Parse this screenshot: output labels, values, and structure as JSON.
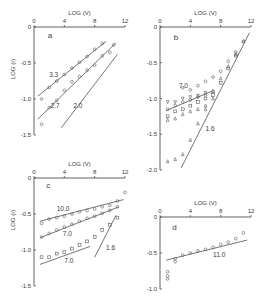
{
  "figure": {
    "colors": {
      "ink": "#3a3a3a",
      "marker": "#5a5a5a",
      "background": "#ffffff"
    }
  },
  "chart_data": [
    {
      "panel": "a",
      "type": "scatter",
      "xlabel": "LOG (V)",
      "ylabel": "LOG (r)",
      "xlim": [
        0,
        12
      ],
      "ylim": [
        -1.5,
        0
      ],
      "xticks": [
        0,
        4,
        8,
        12
      ],
      "yticks": [
        0,
        -0.5,
        -1.0,
        -1.5
      ],
      "ytick_labels": [
        "0",
        "-0.5",
        "-1.0",
        "-1.5"
      ],
      "grid": false,
      "frame": {
        "x": 34,
        "y": 27,
        "w": 91,
        "h": 108
      },
      "series": [
        {
          "name": "3.3",
          "marker": "circle",
          "points": [
            [
              1,
              -1.0
            ],
            [
              2,
              -0.84
            ],
            [
              3,
              -0.75
            ],
            [
              4,
              -0.66
            ],
            [
              5,
              -0.57
            ],
            [
              6,
              -0.49
            ],
            [
              7,
              -0.41
            ],
            [
              8,
              -0.31
            ],
            [
              9,
              -0.23
            ]
          ]
        },
        {
          "name": "2.7",
          "marker": "circle",
          "points": [
            [
              1,
              -1.35
            ],
            [
              2,
              -1.12
            ],
            [
              3,
              -1.02
            ],
            [
              4,
              -0.88
            ],
            [
              5,
              -0.76
            ],
            [
              6,
              -0.69
            ],
            [
              7,
              -0.6
            ],
            [
              8,
              -0.53
            ],
            [
              9,
              -0.4
            ],
            [
              10,
              -0.35
            ],
            [
              10.5,
              -0.25
            ]
          ]
        }
      ],
      "lines": [
        {
          "label": "3.3",
          "from": [
            0.5,
            -0.96
          ],
          "to": [
            9.5,
            -0.2
          ],
          "label_at": [
            2.0,
            -0.7
          ]
        },
        {
          "label": "2.7",
          "from": [
            0.5,
            -1.28
          ],
          "to": [
            10.8,
            -0.22
          ],
          "label_at": [
            2.2,
            -1.12
          ]
        },
        {
          "label": "2.0",
          "from": [
            3.6,
            -1.4
          ],
          "to": [
            11.0,
            -0.38
          ],
          "label_at": [
            5.2,
            -1.12
          ]
        }
      ],
      "annotations": [
        {
          "text": "a",
          "at": [
            1.8,
            -0.15
          ]
        }
      ]
    },
    {
      "panel": "b",
      "type": "scatter",
      "xlabel": "LOG (V)",
      "ylabel": "LOG (r)",
      "xlim": [
        0,
        12
      ],
      "ylim": [
        -2.0,
        0
      ],
      "xticks": [
        0,
        4,
        8,
        12
      ],
      "yticks": [
        0,
        -0.5,
        -1.0,
        -1.5,
        -2.0
      ],
      "ytick_labels": [
        "0",
        "-0.5",
        "-1.0",
        "-1.5",
        "-2.0"
      ],
      "grid": false,
      "frame": {
        "x": 160,
        "y": 27,
        "w": 91,
        "h": 143
      },
      "series": [
        {
          "name": "7.0 (circles)",
          "marker": "circle",
          "points": [
            [
              1,
              -1.15
            ],
            [
              2,
              -1.1
            ],
            [
              3,
              -1.05
            ],
            [
              4,
              -1.02
            ],
            [
              5,
              -0.98
            ],
            [
              6,
              -0.95
            ],
            [
              7,
              -0.9
            ],
            [
              3,
              -0.85
            ],
            [
              4,
              -0.88
            ],
            [
              5,
              -0.82
            ],
            [
              6,
              -0.76
            ],
            [
              7,
              -0.7
            ],
            [
              8,
              -0.62
            ],
            [
              9,
              -0.48
            ],
            [
              10,
              -0.35
            ],
            [
              11,
              -0.2
            ]
          ]
        },
        {
          "name": "7.0 (triangles-down)",
          "marker": "triangle-down",
          "points": [
            [
              1,
              -1.05
            ],
            [
              2,
              -1.05
            ],
            [
              3,
              -1.0
            ],
            [
              4,
              -0.98
            ],
            [
              5,
              -0.96
            ],
            [
              6,
              -0.92
            ]
          ]
        },
        {
          "name": "7.0 (squares)",
          "marker": "square",
          "points": [
            [
              1,
              -1.25
            ],
            [
              2,
              -1.18
            ],
            [
              3,
              -1.15
            ],
            [
              4,
              -1.1
            ],
            [
              5,
              -1.05
            ],
            [
              6,
              -1.0
            ],
            [
              7,
              -0.95
            ],
            [
              8,
              -0.78
            ],
            [
              9,
              -0.58
            ],
            [
              10,
              -0.4
            ]
          ]
        },
        {
          "name": "1.6 (triangles)",
          "marker": "triangle",
          "points": [
            [
              1,
              -1.3
            ],
            [
              2,
              -1.28
            ],
            [
              3,
              -1.22
            ],
            [
              4,
              -1.18
            ],
            [
              5,
              -1.15
            ],
            [
              6,
              -1.1
            ],
            [
              7,
              -1.0
            ],
            [
              1,
              -1.88
            ],
            [
              2,
              -1.85
            ],
            [
              3,
              -1.78
            ],
            [
              4,
              -1.58
            ],
            [
              5,
              -1.35
            ],
            [
              6,
              -1.15
            ],
            [
              7,
              -0.9
            ],
            [
              8,
              -0.72
            ],
            [
              9,
              -0.55
            ],
            [
              10,
              -0.38
            ],
            [
              11,
              -0.2
            ]
          ]
        }
      ],
      "lines": [
        {
          "label": "7.0",
          "from": [
            0.8,
            -1.17
          ],
          "to": [
            6.8,
            -0.9
          ],
          "label_at": [
            2.5,
            -0.85
          ]
        },
        {
          "label": "1.6",
          "from": [
            2.8,
            -1.97
          ],
          "to": [
            11.8,
            -0.08
          ],
          "label_at": [
            6.0,
            -1.45
          ]
        }
      ],
      "annotations": [
        {
          "text": "b",
          "at": [
            1.8,
            -0.18
          ]
        }
      ]
    },
    {
      "panel": "c",
      "type": "scatter",
      "xlabel": "LOG (V)",
      "ylabel": "LOG (r)",
      "xlim": [
        0,
        12
      ],
      "ylim": [
        -1.5,
        0
      ],
      "xticks": [
        0,
        4,
        8,
        12
      ],
      "yticks": [
        0,
        -0.5,
        -1.0,
        -1.5
      ],
      "ytick_labels": [
        "0",
        "-0.5",
        "-1.0",
        "-1.5"
      ],
      "grid": false,
      "frame": {
        "x": 34,
        "y": 178,
        "w": 91,
        "h": 108
      },
      "series": [
        {
          "name": "10.0",
          "marker": "circle",
          "points": [
            [
              1,
              -0.63
            ],
            [
              2,
              -0.57
            ],
            [
              3,
              -0.55
            ],
            [
              4,
              -0.53
            ],
            [
              5,
              -0.5
            ],
            [
              6,
              -0.47
            ],
            [
              7,
              -0.45
            ],
            [
              8,
              -0.43
            ],
            [
              9,
              -0.4
            ],
            [
              10,
              -0.38
            ],
            [
              11,
              -0.32
            ],
            [
              12,
              -0.2
            ]
          ]
        },
        {
          "name": "7.0 upper",
          "marker": "circle",
          "points": [
            [
              1,
              -0.82
            ],
            [
              2,
              -0.77
            ],
            [
              3,
              -0.72
            ],
            [
              4,
              -0.68
            ],
            [
              5,
              -0.64
            ],
            [
              6,
              -0.6
            ],
            [
              7,
              -0.56
            ],
            [
              8,
              -0.53
            ],
            [
              9,
              -0.49
            ],
            [
              10,
              -0.45
            ],
            [
              11,
              -0.4
            ]
          ]
        },
        {
          "name": "7.0 lower",
          "marker": "square",
          "points": [
            [
              1,
              -1.1
            ],
            [
              2,
              -1.1
            ],
            [
              3,
              -1.05
            ],
            [
              4,
              -1.03
            ],
            [
              5,
              -0.98
            ],
            [
              6,
              -0.93
            ],
            [
              7,
              -0.88
            ],
            [
              8,
              -0.82
            ],
            [
              9,
              -0.72
            ],
            [
              10,
              -0.65
            ],
            [
              11,
              -0.55
            ]
          ]
        }
      ],
      "lines": [
        {
          "label": "10.0",
          "from": [
            0.8,
            -0.6
          ],
          "to": [
            11.8,
            -0.3
          ],
          "label_at": [
            3.0,
            -0.46
          ]
        },
        {
          "label": "7.0",
          "from": [
            0.8,
            -0.83
          ],
          "to": [
            11.2,
            -0.4
          ],
          "label_at": [
            3.8,
            -0.8
          ]
        },
        {
          "label": "7.0",
          "from": [
            0.8,
            -1.2
          ],
          "to": [
            7.4,
            -0.95
          ],
          "label_at": [
            4.0,
            -1.18
          ]
        },
        {
          "label": "1.6",
          "from": [
            8.0,
            -1.1
          ],
          "to": [
            10.8,
            -0.52
          ],
          "label_at": [
            9.5,
            -1.0
          ]
        }
      ],
      "annotations": [
        {
          "text": "c",
          "at": [
            1.6,
            -0.14
          ]
        }
      ]
    },
    {
      "panel": "d",
      "type": "scatter",
      "xlabel": "LOG (V)",
      "ylabel": "LOG (r)",
      "xlim": [
        0,
        12
      ],
      "ylim": [
        -1.0,
        0
      ],
      "xticks": [
        0,
        4,
        8,
        12
      ],
      "yticks": [
        0,
        -0.5,
        -1.0
      ],
      "ytick_labels": [
        "0",
        "-0.5",
        "-1.0"
      ],
      "grid": false,
      "frame": {
        "x": 160,
        "y": 217,
        "w": 91,
        "h": 72
      },
      "series": [
        {
          "name": "11.0",
          "marker": "circle",
          "points": [
            [
              1,
              -0.76
            ],
            [
              1,
              -0.82
            ],
            [
              1,
              -0.86
            ],
            [
              2,
              -0.58
            ],
            [
              2,
              -0.62
            ],
            [
              3,
              -0.53
            ],
            [
              4,
              -0.5
            ],
            [
              5,
              -0.47
            ],
            [
              6,
              -0.45
            ],
            [
              7,
              -0.42
            ],
            [
              8,
              -0.38
            ],
            [
              9,
              -0.35
            ],
            [
              10,
              -0.3
            ],
            [
              11,
              -0.22
            ]
          ]
        }
      ],
      "lines": [
        {
          "label": "11.0",
          "from": [
            0.8,
            -0.6
          ],
          "to": [
            11.5,
            -0.32
          ],
          "label_at": [
            7.0,
            -0.56
          ]
        }
      ],
      "annotations": [
        {
          "text": "d",
          "at": [
            1.6,
            -0.18
          ]
        }
      ]
    }
  ]
}
